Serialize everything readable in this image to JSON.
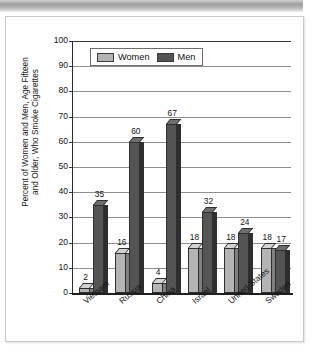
{
  "chart_data": {
    "type": "bar",
    "title": "",
    "xlabel": "",
    "ylabel": "Percent of Women and Men, Age Fifteen and Older, Who Smoke Cigarettes",
    "ylabel_line1": "Percent of Women and Men, Age Fifteen",
    "ylabel_line2": "and Older, Who Smoke Cigarettes",
    "ylim": [
      0,
      100
    ],
    "ytick_step": 10,
    "yticks": [
      "100",
      "90",
      "80",
      "70",
      "60",
      "50",
      "40",
      "30",
      "20",
      "10",
      "0"
    ],
    "grid": true,
    "legend_position": "top-left-inside",
    "categories": [
      "Vietnam",
      "Russia",
      "China",
      "Israel",
      "United States",
      "Sweden"
    ],
    "series": [
      {
        "name": "Women",
        "color": "#b4b4b4",
        "values": [
          2,
          16,
          4,
          18,
          18,
          18
        ]
      },
      {
        "name": "Men",
        "color": "#545454",
        "values": [
          35,
          60,
          67,
          32,
          24,
          17
        ]
      }
    ]
  },
  "legend": {
    "women_label": "Women",
    "men_label": "Men"
  },
  "colors": {
    "women": "#b4b4b4",
    "men": "#545454",
    "axis": "#1f1f1f",
    "grid": "#8e8e8e"
  }
}
